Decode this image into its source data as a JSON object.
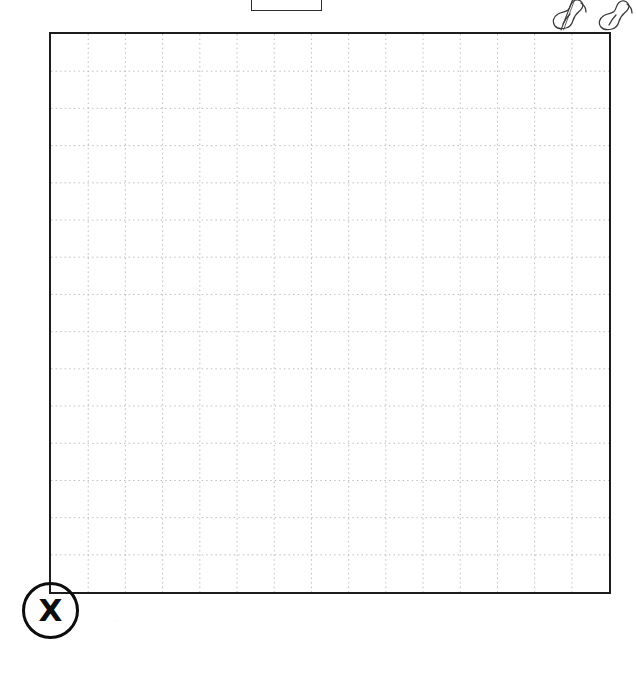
{
  "page": {
    "background_color": "#ffffff",
    "width": 637,
    "height": 675
  },
  "header_box": {
    "name": "cropped-header-box",
    "label": "",
    "border_color": "#2a2a2a",
    "fill_color": "#ffffff",
    "cropped": "true"
  },
  "doodle": {
    "name": "hand-drawn-doodle",
    "label": "",
    "stroke_color": "#3a3a3a",
    "shape_count": 2
  },
  "grid": {
    "name": "dotted-grid-worksheet",
    "label": "",
    "border_color": "#1c1c1c",
    "line_color": "#b9b9b9",
    "fill_color": "#ffffff",
    "columns": 15,
    "rows": 15,
    "cell_size_px": 37.47,
    "line_style": "dotted"
  },
  "x_marker": {
    "name": "x-corner-marker",
    "letter": "X",
    "color": "#0d0d0d",
    "shape": "circle"
  }
}
